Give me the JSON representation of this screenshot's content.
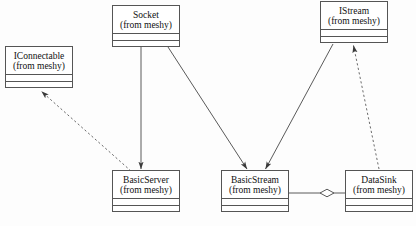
{
  "diagram": {
    "type": "uml-class-diagram",
    "background_color": "#fdfdfd",
    "line_color": "#555555",
    "text_color": "#111111",
    "classes": [
      {
        "id": "iconnectable",
        "name": "IConnectable",
        "package": "(from meshy)",
        "x": 5,
        "y": 46,
        "width": 68,
        "height": 42
      },
      {
        "id": "socket",
        "name": "Socket",
        "package": "(from meshy)",
        "x": 112,
        "y": 5,
        "width": 68,
        "height": 42
      },
      {
        "id": "istream",
        "name": "IStream",
        "package": "(from meshy)",
        "x": 320,
        "y": 1,
        "width": 68,
        "height": 42
      },
      {
        "id": "basicserver",
        "name": "BasicServer",
        "package": "(from meshy)",
        "x": 112,
        "y": 170,
        "width": 68,
        "height": 42
      },
      {
        "id": "basicstream",
        "name": "BasicStream",
        "package": "(from meshy)",
        "x": 221,
        "y": 170,
        "width": 68,
        "height": 42
      },
      {
        "id": "datasink",
        "name": "DataSink",
        "package": "(from meshy)",
        "x": 345,
        "y": 170,
        "width": 68,
        "height": 42
      }
    ],
    "relationships": [
      {
        "id": "basicserver-realizes-iconnectable",
        "kind": "realization",
        "style": "dashed",
        "arrowhead": "open-solid",
        "from": "basicserver",
        "to": "iconnectable",
        "points": "130,170 40,90"
      },
      {
        "id": "socket-to-basicserver",
        "kind": "association",
        "style": "solid",
        "arrowhead": "open-solid",
        "from": "socket",
        "to": "basicserver",
        "points": "141,47 141,168"
      },
      {
        "id": "socket-to-basicstream",
        "kind": "association",
        "style": "solid",
        "arrowhead": "open-solid",
        "from": "socket",
        "to": "basicstream",
        "points": "168,47 247,168"
      },
      {
        "id": "basicstream-realizes-istream",
        "kind": "association",
        "style": "solid",
        "arrowhead": "open-solid",
        "from": "istream",
        "to": "basicstream",
        "points": "333,44 265,168"
      },
      {
        "id": "datasink-realizes-istream",
        "kind": "realization",
        "style": "dashed",
        "arrowhead": "open-solid",
        "from": "datasink",
        "to": "istream",
        "points": "378,168 353,46"
      },
      {
        "id": "basicstream-aggregates-datasink",
        "kind": "aggregation",
        "style": "solid",
        "arrowhead": "hollow-diamond",
        "from": "basicstream",
        "to": "datasink",
        "points": "289,193 345,193",
        "diamond_center_x": 327,
        "diamond_center_y": 193
      }
    ]
  }
}
